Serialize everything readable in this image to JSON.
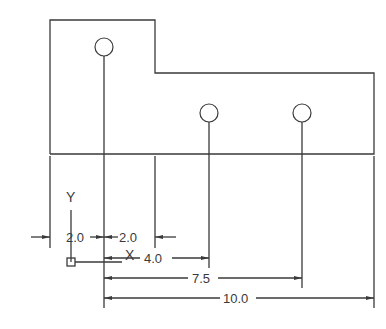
{
  "drawing": {
    "title": "Ordinate / baseline dimensioned part drawing",
    "units_origin": "UCS origin at lower-left reference",
    "axis_labels": {
      "x": "X",
      "y": "Y"
    },
    "part_outline": {
      "description": "L-shaped plate: tall left section with one hole, lower right section with two holes"
    },
    "holes": [
      {
        "id": "hole-1",
        "position": "left tall section"
      },
      {
        "id": "hole-2",
        "position": "right section, middle"
      },
      {
        "id": "hole-3",
        "position": "right section, right"
      }
    ],
    "dimensions": [
      {
        "id": "dim-left-2",
        "label": "2.0"
      },
      {
        "id": "dim-right-2",
        "label": "2.0"
      },
      {
        "id": "dim-4",
        "label": "4.0"
      },
      {
        "id": "dim-7-5",
        "label": "7.5"
      },
      {
        "id": "dim-10",
        "label": "10.0"
      }
    ],
    "colors": {
      "line": "#3a3a3a",
      "background": "#ffffff"
    }
  }
}
